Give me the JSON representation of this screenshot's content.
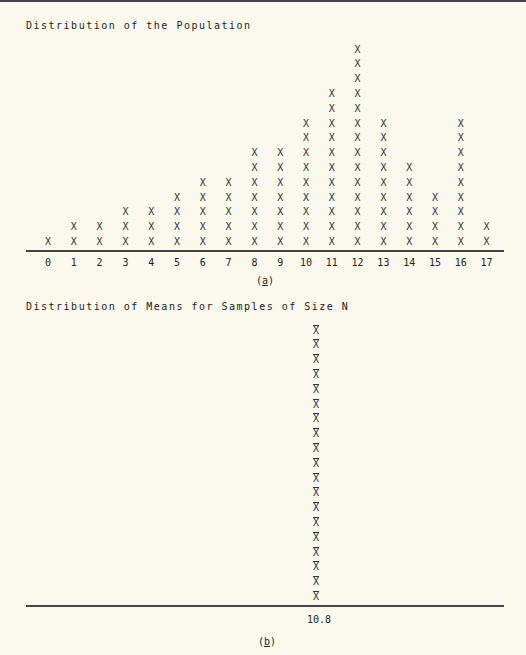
{
  "chart_data": [
    {
      "type": "dot-plot",
      "title": "Distribution of the Population",
      "caption": "(a)",
      "caption_letter": "a",
      "marker": "X",
      "categories": [
        "0",
        "1",
        "2",
        "3",
        "4",
        "5",
        "6",
        "7",
        "8",
        "9",
        "10",
        "11",
        "12",
        "13",
        "14",
        "15",
        "16",
        "17"
      ],
      "values": [
        1,
        2,
        2,
        3,
        3,
        4,
        5,
        5,
        7,
        7,
        9,
        11,
        14,
        9,
        6,
        4,
        9,
        2
      ],
      "xlabel": "",
      "ylabel": "",
      "grid": false
    },
    {
      "type": "dot-plot",
      "title": "Distribution of Means for Samples of Size N",
      "caption": "(b)",
      "caption_letter": "b",
      "marker": "X̄",
      "categories": [
        "10.8"
      ],
      "values": [
        19
      ],
      "xlabel": "",
      "ylabel": "",
      "grid": false
    }
  ]
}
